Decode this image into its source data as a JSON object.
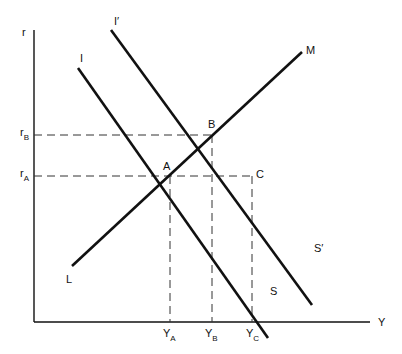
{
  "diagram": {
    "axes": {
      "y_label": "r",
      "x_label": "Y"
    },
    "curves": [
      {
        "id": "IS",
        "start_label": "I",
        "end_label": "S"
      },
      {
        "id": "IS_shifted",
        "start_label": "I′",
        "end_label": "S′"
      },
      {
        "id": "LM",
        "start_label": "L",
        "end_label": "M"
      }
    ],
    "points": [
      {
        "label": "A"
      },
      {
        "label": "B"
      },
      {
        "label": "C"
      }
    ],
    "y_ticks": [
      {
        "main": "r",
        "sub": "B"
      },
      {
        "main": "r",
        "sub": "A"
      }
    ],
    "x_ticks": [
      {
        "main": "Y",
        "sub": "A"
      },
      {
        "main": "Y",
        "sub": "B"
      },
      {
        "main": "Y",
        "sub": "C"
      }
    ],
    "colors": {
      "line": "#111111",
      "dashed": "#333333"
    }
  }
}
